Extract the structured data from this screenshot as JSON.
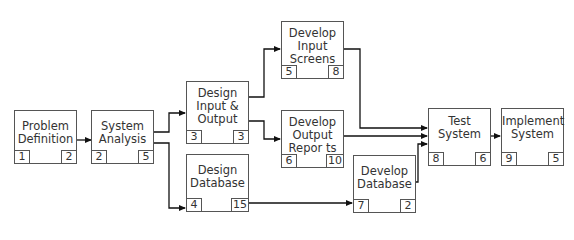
{
  "diagram": {
    "type": "network-precedence-diagram",
    "nodes": [
      {
        "id": "problem_definition",
        "label": "Problem\nDefinition",
        "left": "1",
        "right": "2"
      },
      {
        "id": "system_analysis",
        "label": "System\nAnalysis",
        "left": "2",
        "right": "5"
      },
      {
        "id": "design_io",
        "label": "Design\nInput &\nOutput",
        "left": "3",
        "right": "3"
      },
      {
        "id": "design_database",
        "label": "Design\nDatabase",
        "left": "4",
        "right": "15"
      },
      {
        "id": "develop_input_screens",
        "label": "Develop\nInput\nScreens",
        "left": "5",
        "right": "8"
      },
      {
        "id": "develop_output_reports",
        "label": "Develop\nOutput\nRepor ts",
        "left": "6",
        "right": "10"
      },
      {
        "id": "develop_database",
        "label": "Develop\nDatabase",
        "left": "7",
        "right": "2"
      },
      {
        "id": "test_system",
        "label": "Test\nSystem",
        "left": "8",
        "right": "6"
      },
      {
        "id": "implement_system",
        "label": "Implement\nSystem",
        "left": "9",
        "right": "5"
      }
    ],
    "edges": [
      {
        "from": "problem_definition",
        "to": "system_analysis"
      },
      {
        "from": "system_analysis",
        "to": "design_io"
      },
      {
        "from": "system_analysis",
        "to": "design_database"
      },
      {
        "from": "design_io",
        "to": "develop_input_screens"
      },
      {
        "from": "design_io",
        "to": "develop_output_reports"
      },
      {
        "from": "design_database",
        "to": "develop_database"
      },
      {
        "from": "develop_input_screens",
        "to": "test_system"
      },
      {
        "from": "develop_output_reports",
        "to": "test_system"
      },
      {
        "from": "develop_database",
        "to": "test_system"
      },
      {
        "from": "test_system",
        "to": "implement_system"
      }
    ]
  }
}
